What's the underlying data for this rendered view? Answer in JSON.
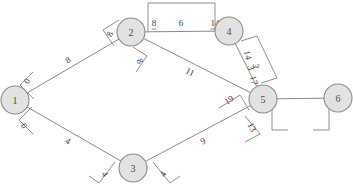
{
  "diagram": {
    "type": "weighted-undirected-graph",
    "title": "",
    "background_color": "#ffffff",
    "node_fill": "#e2e2e2",
    "node_stroke": "#8c8c8c",
    "edge_stroke": "#8a8a8a",
    "nodes": [
      {
        "id": "1",
        "label": "1",
        "x": 15,
        "y": 100
      },
      {
        "id": "2",
        "label": "2",
        "x": 131,
        "y": 32
      },
      {
        "id": "3",
        "label": "3",
        "x": 133,
        "y": 168
      },
      {
        "id": "4",
        "label": "4",
        "x": 229,
        "y": 31
      },
      {
        "id": "5",
        "label": "5",
        "x": 263,
        "y": 99
      },
      {
        "id": "6",
        "label": "6",
        "x": 338,
        "y": 98
      }
    ],
    "edges": [
      {
        "from": "1",
        "to": "2",
        "weight": "8",
        "wx": 68,
        "wy": 60,
        "wrot": -30
      },
      {
        "from": "2",
        "to": "4",
        "weight": "6",
        "wx": 181,
        "wy": 23,
        "wrot": 0
      },
      {
        "from": "2",
        "to": "5",
        "weight": "11",
        "wx": 190,
        "wy": 72,
        "wrot": 27
      },
      {
        "from": "1",
        "to": "3",
        "weight": "4",
        "wx": 68,
        "wy": 141,
        "wrot": 30
      },
      {
        "from": "3",
        "to": "5",
        "weight": "9",
        "wx": 203,
        "wy": 141,
        "wrot": -30
      },
      {
        "from": "4",
        "to": "5",
        "weight": "3",
        "wx": 256,
        "wy": 66,
        "wrot": 90
      },
      {
        "from": "5",
        "to": "6",
        "weight": "",
        "wx": 300,
        "wy": 90,
        "wrot": 0
      }
    ],
    "brackets": [
      {
        "id": "node1-upper",
        "labels": [
          "0"
        ],
        "lx": 27,
        "ly": 81,
        "lrot": -58
      },
      {
        "id": "node1-lower",
        "labels": [
          "0"
        ],
        "lx": 24,
        "ly": 126,
        "lrot": 60
      },
      {
        "id": "node2-left",
        "labels": [
          "8"
        ],
        "lx": 110,
        "ly": 34,
        "lrot": -62
      },
      {
        "id": "node2-lower",
        "labels": [
          "8"
        ],
        "lx": 140,
        "ly": 61,
        "lrot": 62
      },
      {
        "id": "edge24-top",
        "labels": [
          "8",
          "14"
        ],
        "lx": 154,
        "ly": 23,
        "lrot": 0
      },
      {
        "id": "edge45-side",
        "labels": [
          "14",
          "3",
          "17"
        ],
        "lx": 248,
        "ly": 55,
        "lrot": 77
      },
      {
        "id": "edge25-near5",
        "labels": [
          "19"
        ],
        "lx": 229,
        "ly": 100,
        "lrot": -32
      },
      {
        "id": "edge35-near5",
        "labels": [
          "13"
        ],
        "lx": 252,
        "ly": 127,
        "lrot": 62
      },
      {
        "id": "node3-left",
        "labels": [
          "4"
        ],
        "lx": 105,
        "ly": 174,
        "lrot": 58
      },
      {
        "id": "node3-right",
        "labels": [
          "4"
        ],
        "lx": 163,
        "ly": 174,
        "lrot": -58
      },
      {
        "id": "edge56-below",
        "labels": [],
        "lx": 300,
        "ly": 122,
        "lrot": 0
      }
    ]
  }
}
